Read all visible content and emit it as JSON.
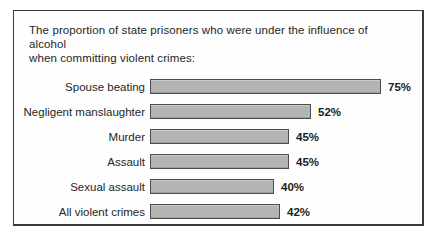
{
  "figure": {
    "title_lines": [
      "The proportion of state prisoners who were under the influence of alcohol",
      "when committing violent crimes:"
    ]
  },
  "chart_data": {
    "type": "bar",
    "orientation": "horizontal",
    "title": "The proportion of state prisoners who were under the influence of alcohol when committing violent crimes:",
    "categories": [
      "Spouse beating",
      "Negligent manslaughter",
      "Murder",
      "Assault",
      "Sexual assault",
      "All violent crimes"
    ],
    "values": [
      75,
      52,
      45,
      45,
      40,
      42
    ],
    "data_labels": [
      "75%",
      "52%",
      "45%",
      "45%",
      "40%",
      "42%"
    ],
    "xlim": [
      0,
      100
    ],
    "grid": false,
    "legend": "none",
    "axis_shown": false,
    "colors": {
      "bar_fill": "#b4b4b4",
      "bar_border": "#4d4d4d",
      "frame_border": "#3a3a3a",
      "text": "#262626"
    }
  }
}
